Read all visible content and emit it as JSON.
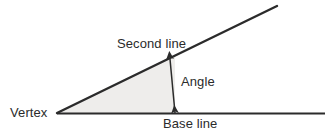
{
  "diagram": {
    "background_color": "#ffffff",
    "width": 333,
    "height": 139,
    "labels": {
      "vertex": "Vertex",
      "second_line": "Second line",
      "angle": "Angle",
      "base_line": "Base line"
    },
    "colors": {
      "line": "#2b2b2b",
      "text": "#2b2b2b",
      "fill": "#eeedeb",
      "arrow": "#2b2b2b"
    },
    "geometry": {
      "vertex_point": [
        57,
        113
      ],
      "base_line": {
        "from": [
          57,
          113.5
        ],
        "to": [
          325,
          113.5
        ],
        "stroke_width": 2.2
      },
      "second_line": {
        "from": [
          57,
          113
        ],
        "to": [
          277,
          6
        ],
        "stroke_width": 2.4
      },
      "shaded_region": "57,113 175,56 175,113",
      "angle_arrow": {
        "from": [
          170,
          59
        ],
        "to": [
          175,
          113
        ],
        "stroke_width": 1.5,
        "double_headed": true
      }
    }
  }
}
